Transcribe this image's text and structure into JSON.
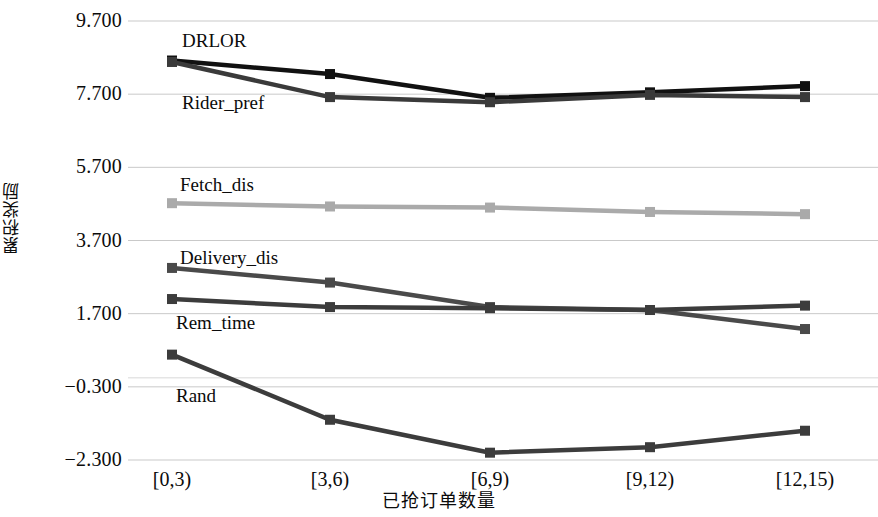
{
  "chart_data": {
    "type": "line",
    "title": "",
    "xlabel": "已抢订单数量",
    "ylabel": "累积奖励",
    "categories": [
      "[0,3)",
      "[3,6)",
      "[6,9)",
      "[9,12)",
      "[12,15)"
    ],
    "yticks": [
      "9.700",
      "7.700",
      "5.700",
      "3.700",
      "1.700",
      "-0.300",
      "-2.300"
    ],
    "ytick_values": [
      9.7,
      7.7,
      5.7,
      3.7,
      1.7,
      -0.3,
      -2.3
    ],
    "ylim": [
      -2.3,
      9.7
    ],
    "grid": true,
    "legend": "inline-annotations",
    "series": [
      {
        "name": "DRLOR",
        "color": "#111111",
        "label_x": 182,
        "label_y": 30,
        "values": [
          8.62,
          8.25,
          7.6,
          7.75,
          7.92
        ]
      },
      {
        "name": "Rider_pref",
        "color": "#3a3a3a",
        "label_x": 182,
        "label_y": 92,
        "values": [
          8.58,
          7.62,
          7.48,
          7.68,
          7.62
        ]
      },
      {
        "name": "Fetch_dis",
        "color": "#aaaaaa",
        "label_x": 180,
        "label_y": 174,
        "values": [
          4.72,
          4.63,
          4.6,
          4.48,
          4.42
        ]
      },
      {
        "name": "Delivery_dis",
        "color": "#4a4a4a",
        "label_x": 180,
        "label_y": 247,
        "values": [
          2.95,
          2.55,
          1.88,
          1.8,
          1.28
        ]
      },
      {
        "name": "Rem_time",
        "color": "#3c3c3c",
        "label_x": 176,
        "label_y": 312,
        "values": [
          2.1,
          1.88,
          1.85,
          1.8,
          1.92
        ]
      },
      {
        "name": "Rand",
        "color": "#3c3c3c",
        "label_x": 176,
        "label_y": 385,
        "values": [
          0.58,
          -1.2,
          -2.1,
          -1.95,
          -1.5
        ]
      }
    ]
  },
  "axis": {
    "y_title": "累积奖励",
    "x_title": "已抢订单数量"
  }
}
